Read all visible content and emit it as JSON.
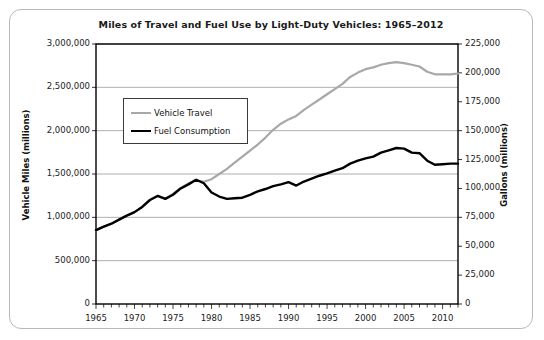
{
  "figure": {
    "title": "Miles of Travel and Fuel Use by Light-Duty Vehicles: 1965–2012",
    "border_color": "#b8b8b8",
    "background": "#ffffff"
  },
  "legend": {
    "position": "inside-upper-left",
    "entries": [
      {
        "label": "Vehicle Travel",
        "color": "#a8a8a8"
      },
      {
        "label": "Fuel Consumption",
        "color": "#000000"
      }
    ]
  },
  "axes": {
    "left": {
      "title": "Vehicle Miles (millions)",
      "ticks": [
        "0",
        "500,000",
        "1,000,000",
        "1,500,000",
        "2,000,000",
        "2,500,000",
        "3,000,000"
      ]
    },
    "right": {
      "title": "Gallons (millions)",
      "ticks": [
        "0",
        "25,000",
        "50,000",
        "75,000",
        "100,000",
        "125,000",
        "150,000",
        "175,000",
        "200,000",
        "225,000"
      ]
    },
    "x": {
      "title": "",
      "ticks": [
        "1965",
        "1970",
        "1975",
        "1980",
        "1985",
        "1990",
        "1995",
        "2000",
        "2005",
        "2010"
      ]
    }
  },
  "chart_data": {
    "type": "line",
    "title": "Miles of Travel and Fuel Use by Light-Duty Vehicles: 1965–2012",
    "xlabel": "",
    "ylabel": "Vehicle Miles (millions)",
    "y2label": "Gallons (millions)",
    "xlim": [
      1965,
      2012
    ],
    "ylim": [
      0,
      3000000
    ],
    "y2lim": [
      0,
      225000
    ],
    "ytick_step": 500000,
    "y2tick_step": 25000,
    "xtick_step": 5,
    "xtick_minor_step": 1,
    "grid": "horizontal-only",
    "legend_position": "upper-left-inside",
    "x": [
      1965,
      1966,
      1967,
      1968,
      1969,
      1970,
      1971,
      1972,
      1973,
      1974,
      1975,
      1976,
      1977,
      1978,
      1979,
      1980,
      1981,
      1982,
      1983,
      1984,
      1985,
      1986,
      1987,
      1988,
      1989,
      1990,
      1991,
      1992,
      1993,
      1994,
      1995,
      1996,
      1997,
      1998,
      1999,
      2000,
      2001,
      2002,
      2003,
      2004,
      2005,
      2006,
      2007,
      2008,
      2009,
      2010,
      2011,
      2012
    ],
    "series": [
      {
        "name": "Vehicle Travel",
        "axis": "left",
        "color": "#a8a8a8",
        "unit": "million miles",
        "values": [
          850000,
          890000,
          925000,
          975000,
          1020000,
          1060000,
          1120000,
          1200000,
          1250000,
          1215000,
          1270000,
          1340000,
          1390000,
          1430000,
          1410000,
          1440000,
          1500000,
          1560000,
          1630000,
          1700000,
          1770000,
          1840000,
          1920000,
          2010000,
          2080000,
          2130000,
          2170000,
          2240000,
          2300000,
          2360000,
          2420000,
          2480000,
          2540000,
          2620000,
          2670000,
          2710000,
          2730000,
          2760000,
          2780000,
          2790000,
          2780000,
          2760000,
          2740000,
          2680000,
          2650000,
          2650000,
          2650000,
          2660000
        ]
      },
      {
        "name": "Fuel Consumption",
        "axis": "right",
        "color": "#000000",
        "unit": "million gallons",
        "values": [
          64000,
          67000,
          69500,
          73000,
          76500,
          79500,
          84000,
          90000,
          93500,
          91000,
          94500,
          100000,
          103500,
          107500,
          104500,
          96500,
          93000,
          91000,
          91500,
          92000,
          94500,
          97500,
          99500,
          102000,
          103500,
          105500,
          102500,
          106000,
          108500,
          111000,
          113000,
          115500,
          117500,
          121500,
          124000,
          126000,
          127500,
          131000,
          133000,
          135000,
          134500,
          131000,
          130500,
          124000,
          120500,
          121000,
          121500,
          121500
        ]
      }
    ]
  }
}
